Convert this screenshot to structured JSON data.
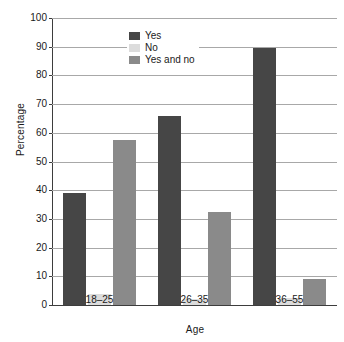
{
  "chart_data": {
    "type": "bar",
    "title": "",
    "subtitle": "",
    "xlabel": "Age",
    "ylabel": "Percentage",
    "categories": [
      "18–25",
      "26–35",
      "36–55"
    ],
    "series": [
      {
        "name": "Yes",
        "values": [
          39,
          66,
          89.5
        ],
        "color": "#464646"
      },
      {
        "name": "No",
        "values": [
          4,
          2,
          2.5
        ],
        "color": "#dcdcdc"
      },
      {
        "name": "Yes and no",
        "values": [
          57.5,
          32.5,
          9
        ],
        "color": "#8a8a8a"
      }
    ],
    "ylim": [
      0,
      100
    ],
    "ytick_step": 10,
    "yticks": [
      0,
      10,
      20,
      30,
      40,
      50,
      60,
      70,
      80,
      90,
      100
    ],
    "ytick_labels": [
      "0",
      "10",
      "20",
      "30",
      "40",
      "50",
      "60",
      "70",
      "80",
      "90",
      "100"
    ],
    "grid": true,
    "grid_axis": "y",
    "legend_position": "top-left-inside",
    "bar_group_count": 3,
    "bars_per_group": 3
  },
  "legend": {
    "items": [
      {
        "label": "Yes"
      },
      {
        "label": "No"
      },
      {
        "label": "Yes and no"
      }
    ]
  },
  "axes": {
    "y_title": "Percentage",
    "x_title": "Age"
  }
}
